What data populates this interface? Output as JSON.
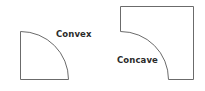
{
  "diagram": {
    "shapes": [
      {
        "id": "convex",
        "label": "Convex",
        "corner_type": "convex",
        "description": "quarter-round shape with outward-curving corner"
      },
      {
        "id": "concave",
        "label": "Concave",
        "corner_type": "concave",
        "description": "square with inward-curving cove corner"
      }
    ],
    "colors": {
      "stroke": "#6b6b6b",
      "fill": "#ffffff",
      "text": "#2b2b2b"
    }
  }
}
